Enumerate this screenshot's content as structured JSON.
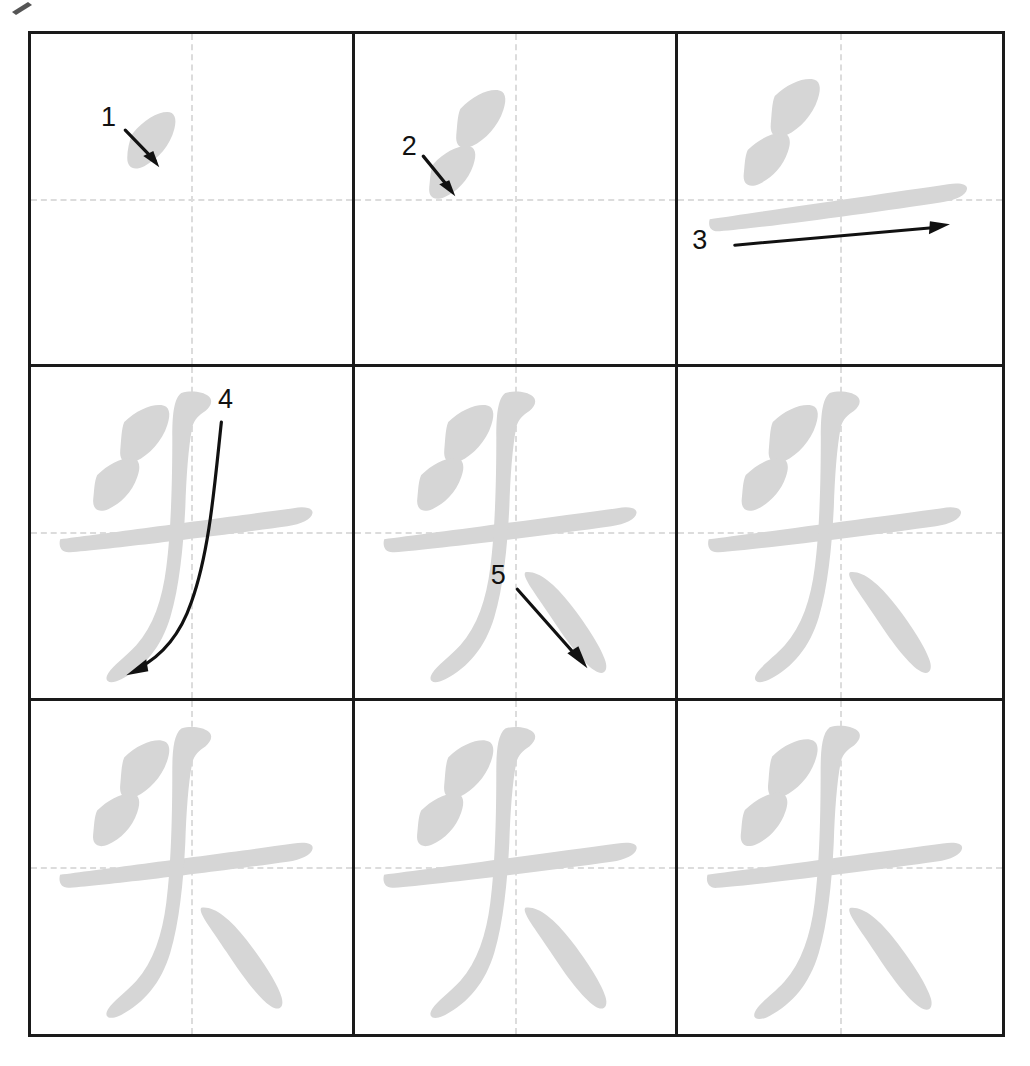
{
  "character": {
    "glyph": "头",
    "pinyin": "tóu",
    "total_strokes": 5
  },
  "colors": {
    "stroke_gray": "#d6d6d6",
    "grid_border": "#1a1a1a",
    "guide_dash": "#dcdcdc",
    "annotation_black": "#111111",
    "background": "#ffffff"
  },
  "grid": {
    "rows": 3,
    "columns": 3,
    "guides": "dashed-crosshair"
  },
  "cells": [
    {
      "index": 1,
      "row": 1,
      "col": 1,
      "strokes_shown": 1,
      "new_stroke_label": "1",
      "arrow": "down-right",
      "name": "stroke-step-1"
    },
    {
      "index": 2,
      "row": 1,
      "col": 2,
      "strokes_shown": 2,
      "new_stroke_label": "2",
      "arrow": "down-right",
      "name": "stroke-step-2"
    },
    {
      "index": 3,
      "row": 1,
      "col": 3,
      "strokes_shown": 3,
      "new_stroke_label": "3",
      "arrow": "right",
      "name": "stroke-step-3"
    },
    {
      "index": 4,
      "row": 2,
      "col": 1,
      "strokes_shown": 4,
      "new_stroke_label": "4",
      "arrow": "curve-down-left",
      "name": "stroke-step-4"
    },
    {
      "index": 5,
      "row": 2,
      "col": 2,
      "strokes_shown": 5,
      "new_stroke_label": "5",
      "arrow": "down-right",
      "name": "stroke-step-5"
    },
    {
      "index": 6,
      "row": 2,
      "col": 3,
      "strokes_shown": 5,
      "new_stroke_label": "",
      "arrow": "",
      "name": "completed-character-1"
    },
    {
      "index": 7,
      "row": 3,
      "col": 1,
      "strokes_shown": 5,
      "new_stroke_label": "",
      "arrow": "",
      "name": "completed-character-2"
    },
    {
      "index": 8,
      "row": 3,
      "col": 2,
      "strokes_shown": 5,
      "new_stroke_label": "",
      "arrow": "",
      "name": "completed-character-3"
    },
    {
      "index": 9,
      "row": 3,
      "col": 3,
      "strokes_shown": 5,
      "new_stroke_label": "",
      "arrow": "",
      "name": "completed-character-4"
    }
  ],
  "labels": {
    "s1": "1",
    "s2": "2",
    "s3": "3",
    "s4": "4",
    "s5": "5"
  }
}
